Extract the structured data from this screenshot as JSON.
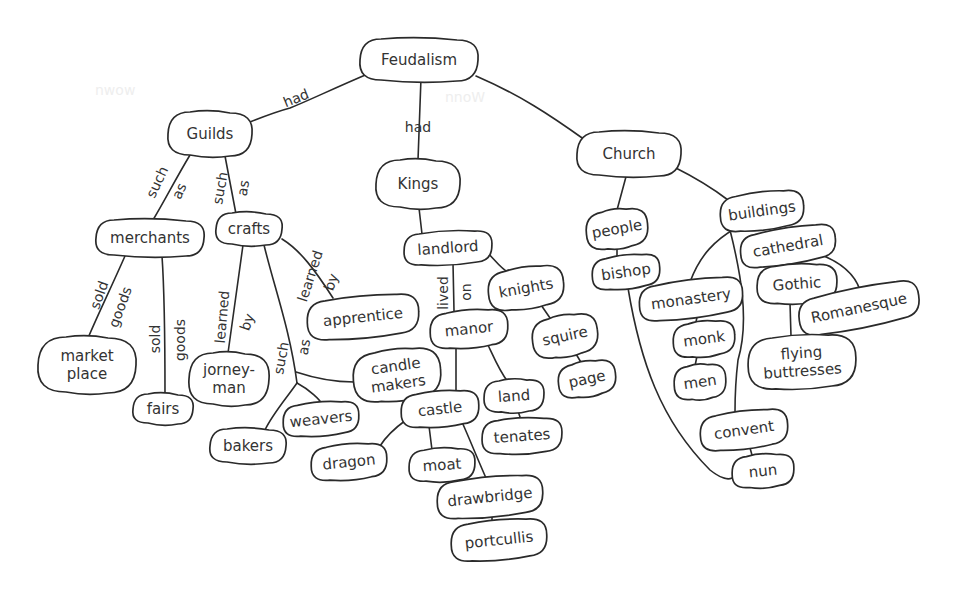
{
  "diagram": {
    "type": "concept-map",
    "root": "Feudalism",
    "colors": {
      "ink": "#2a2a2a",
      "text": "#333333",
      "background": "#ffffff"
    },
    "nodes": [
      {
        "id": "feudalism",
        "label": [
          "Feudalism"
        ],
        "x": 419,
        "y": 60,
        "w": 118,
        "h": 42,
        "rot": 0
      },
      {
        "id": "guilds",
        "label": [
          "Guilds"
        ],
        "x": 210,
        "y": 134,
        "w": 84,
        "h": 44,
        "rot": 0
      },
      {
        "id": "kings",
        "label": [
          "Kings"
        ],
        "x": 418,
        "y": 184,
        "w": 84,
        "h": 48,
        "rot": 0
      },
      {
        "id": "church",
        "label": [
          "Church"
        ],
        "x": 629,
        "y": 154,
        "w": 104,
        "h": 44,
        "rot": 0
      },
      {
        "id": "merchants",
        "label": [
          "merchants"
        ],
        "x": 150,
        "y": 238,
        "w": 108,
        "h": 36,
        "rot": 0
      },
      {
        "id": "crafts",
        "label": [
          "crafts"
        ],
        "x": 249,
        "y": 229,
        "w": 66,
        "h": 32,
        "rot": 0
      },
      {
        "id": "landlord",
        "label": [
          "landlord"
        ],
        "x": 448,
        "y": 248,
        "w": 88,
        "h": 32,
        "rot": -4
      },
      {
        "id": "people",
        "label": [
          "people"
        ],
        "x": 617,
        "y": 229,
        "w": 62,
        "h": 38,
        "rot": -10
      },
      {
        "id": "buildings",
        "label": [
          "buildings"
        ],
        "x": 762,
        "y": 211,
        "w": 84,
        "h": 36,
        "rot": -8
      },
      {
        "id": "marketplace",
        "label": [
          "market",
          "place"
        ],
        "x": 87,
        "y": 365,
        "w": 98,
        "h": 56,
        "rot": 0
      },
      {
        "id": "fairs",
        "label": [
          "fairs"
        ],
        "x": 163,
        "y": 409,
        "w": 60,
        "h": 30,
        "rot": 0
      },
      {
        "id": "jorneyman",
        "label": [
          "jorney-",
          "man"
        ],
        "x": 229,
        "y": 379,
        "w": 80,
        "h": 52,
        "rot": 0
      },
      {
        "id": "apprentice",
        "label": [
          "apprentice"
        ],
        "x": 363,
        "y": 317,
        "w": 112,
        "h": 40,
        "rot": -6
      },
      {
        "id": "candlemakers",
        "label": [
          "candle",
          "makers"
        ],
        "x": 397,
        "y": 375,
        "w": 88,
        "h": 50,
        "rot": -8
      },
      {
        "id": "weavers",
        "label": [
          "weavers"
        ],
        "x": 321,
        "y": 419,
        "w": 76,
        "h": 32,
        "rot": -6
      },
      {
        "id": "bakers",
        "label": [
          "bakers"
        ],
        "x": 248,
        "y": 446,
        "w": 76,
        "h": 34,
        "rot": 0
      },
      {
        "id": "knights",
        "label": [
          "knights"
        ],
        "x": 526,
        "y": 288,
        "w": 76,
        "h": 40,
        "rot": -10
      },
      {
        "id": "manor",
        "label": [
          "manor"
        ],
        "x": 469,
        "y": 329,
        "w": 78,
        "h": 36,
        "rot": -6
      },
      {
        "id": "squire",
        "label": [
          "squire"
        ],
        "x": 565,
        "y": 336,
        "w": 66,
        "h": 40,
        "rot": -12
      },
      {
        "id": "page",
        "label": [
          "page"
        ],
        "x": 587,
        "y": 379,
        "w": 58,
        "h": 34,
        "rot": -12
      },
      {
        "id": "castle",
        "label": [
          "castle"
        ],
        "x": 440,
        "y": 409,
        "w": 78,
        "h": 34,
        "rot": -6
      },
      {
        "id": "land",
        "label": [
          "land"
        ],
        "x": 514,
        "y": 396,
        "w": 60,
        "h": 32,
        "rot": -4
      },
      {
        "id": "tenates",
        "label": [
          "tenates"
        ],
        "x": 522,
        "y": 436,
        "w": 80,
        "h": 34,
        "rot": -4
      },
      {
        "id": "dragon",
        "label": [
          "dragon"
        ],
        "x": 349,
        "y": 462,
        "w": 76,
        "h": 34,
        "rot": -6
      },
      {
        "id": "moat",
        "label": [
          "moat"
        ],
        "x": 442,
        "y": 465,
        "w": 66,
        "h": 32,
        "rot": -4
      },
      {
        "id": "drawbridge",
        "label": [
          "drawbridge"
        ],
        "x": 490,
        "y": 497,
        "w": 106,
        "h": 38,
        "rot": -6
      },
      {
        "id": "portcullis",
        "label": [
          "portcullis"
        ],
        "x": 499,
        "y": 540,
        "w": 96,
        "h": 38,
        "rot": -6
      },
      {
        "id": "bishop",
        "label": [
          "bishop"
        ],
        "x": 626,
        "y": 272,
        "w": 68,
        "h": 32,
        "rot": -8
      },
      {
        "id": "cathedral",
        "label": [
          "cathedral"
        ],
        "x": 788,
        "y": 246,
        "w": 96,
        "h": 34,
        "rot": -10
      },
      {
        "id": "monastery",
        "label": [
          "monastery"
        ],
        "x": 691,
        "y": 299,
        "w": 104,
        "h": 36,
        "rot": -8
      },
      {
        "id": "gothic",
        "label": [
          "Gothic"
        ],
        "x": 797,
        "y": 284,
        "w": 80,
        "h": 38,
        "rot": -4
      },
      {
        "id": "romanesque",
        "label": [
          "Romanesque"
        ],
        "x": 859,
        "y": 308,
        "w": 122,
        "h": 38,
        "rot": -12
      },
      {
        "id": "monk",
        "label": [
          "monk"
        ],
        "x": 704,
        "y": 339,
        "w": 62,
        "h": 34,
        "rot": -8
      },
      {
        "id": "men",
        "label": [
          "men"
        ],
        "x": 700,
        "y": 382,
        "w": 52,
        "h": 34,
        "rot": -8
      },
      {
        "id": "flyingbuttresses",
        "label": [
          "flying",
          "buttresses"
        ],
        "x": 802,
        "y": 362,
        "w": 108,
        "h": 52,
        "rot": -4
      },
      {
        "id": "convent",
        "label": [
          "convent"
        ],
        "x": 744,
        "y": 430,
        "w": 88,
        "h": 36,
        "rot": -8
      },
      {
        "id": "nun",
        "label": [
          "nun"
        ],
        "x": 763,
        "y": 471,
        "w": 62,
        "h": 32,
        "rot": -6
      }
    ],
    "edges": [
      {
        "from": "feudalism",
        "to": "guilds",
        "path": "M370,73 C330,90 310,100 290,108 C275,112 260,118 250,122"
      },
      {
        "from": "feudalism",
        "to": "kings",
        "path": "M421,78 L418,160"
      },
      {
        "from": "feudalism",
        "to": "church",
        "path": "M476,76 C520,95 550,115 585,140"
      },
      {
        "from": "guilds",
        "to": "merchants",
        "path": "M190,155 C175,180 165,200 153,220"
      },
      {
        "from": "guilds",
        "to": "crafts",
        "path": "M225,156 L236,214"
      },
      {
        "from": "kings",
        "to": "landlord",
        "path": "M419,208 L422,234"
      },
      {
        "from": "church",
        "to": "people",
        "path": "M627,173 L617,210"
      },
      {
        "from": "church",
        "to": "buildings",
        "path": "M674,167 C700,180 715,190 728,200"
      },
      {
        "from": "merchants",
        "to": "marketplace",
        "path": "M125,256 C110,290 100,310 88,338"
      },
      {
        "from": "merchants",
        "to": "fairs",
        "path": "M162,256 C165,300 165,350 165,394"
      },
      {
        "from": "crafts",
        "to": "jorneyman",
        "path": "M243,245 L228,353"
      },
      {
        "from": "crafts",
        "to": "apprentice",
        "path": "M282,239 C300,250 315,270 333,298"
      },
      {
        "from": "crafts",
        "to": "junction",
        "path": "M264,245 C275,290 290,330 297,383"
      },
      {
        "from": "junction",
        "to": "candlemakers",
        "path": "M296,372 C320,380 340,382 354,382"
      },
      {
        "from": "junction",
        "to": "weavers",
        "path": "M297,383 C310,390 320,400 322,404"
      },
      {
        "from": "junction",
        "to": "bakers",
        "path": "M297,383 C285,400 272,415 265,430"
      },
      {
        "from": "landlord",
        "to": "manor",
        "path": "M453,263 L454,311"
      },
      {
        "from": "landlord",
        "to": "knights",
        "path": "M484,249 C495,260 502,270 508,272"
      },
      {
        "from": "knights",
        "to": "squire",
        "path": "M539,302 L550,318"
      },
      {
        "from": "squire",
        "to": "page",
        "path": "M576,354 L582,364"
      },
      {
        "from": "manor",
        "to": "castle",
        "path": "M456,347 L456,392"
      },
      {
        "from": "manor",
        "to": "land",
        "path": "M488,345 C495,360 500,372 508,382"
      },
      {
        "from": "land",
        "to": "tenates",
        "path": "M518,411 L521,420"
      },
      {
        "from": "castle",
        "to": "dragon",
        "path": "M406,420 C395,428 385,438 380,446"
      },
      {
        "from": "castle",
        "to": "moat",
        "path": "M429,426 L432,450"
      },
      {
        "from": "castle",
        "to": "drawbridge",
        "path": "M462,422 C470,440 478,460 486,478"
      },
      {
        "from": "drawbridge",
        "to": "portcullis",
        "path": "M492,516 L492,522"
      },
      {
        "from": "people",
        "to": "bishop",
        "path": "M617,247 L617,257"
      },
      {
        "from": "bishop",
        "to": "nun",
        "path": "M628,288 C640,360 660,420 710,470 C720,478 728,480 732,478"
      },
      {
        "from": "buildings",
        "to": "monastery",
        "path": "M736,228 C715,240 700,255 690,282"
      },
      {
        "from": "buildings",
        "to": "convent",
        "path": "M730,230 C740,270 750,320 738,360 C735,385 735,400 735,412"
      },
      {
        "from": "buildings",
        "to": "cathedral",
        "path": "M774,228 L776,232"
      },
      {
        "from": "cathedral",
        "to": "gothic",
        "path": "M792,262 L793,265"
      },
      {
        "from": "cathedral",
        "to": "romanesque",
        "path": "M810,251 C840,260 855,275 860,290"
      },
      {
        "from": "gothic",
        "to": "flyingbuttresses",
        "path": "M790,303 L791,336"
      },
      {
        "from": "monastery",
        "to": "monk",
        "path": "M697,317 L696,322"
      },
      {
        "from": "monk",
        "to": "men",
        "path": "M697,356 L695,366"
      },
      {
        "from": "convent",
        "to": "nun",
        "path": "M750,448 L752,455"
      }
    ],
    "link_labels": [
      {
        "text": "had",
        "x": 296,
        "y": 98,
        "rot": -22
      },
      {
        "text": "had",
        "x": 418,
        "y": 127,
        "rot": 0
      },
      {
        "text": "such",
        "x": 157,
        "y": 182,
        "rot": -65
      },
      {
        "text": "as",
        "x": 179,
        "y": 191,
        "rot": -65
      },
      {
        "text": "such",
        "x": 220,
        "y": 188,
        "rot": -80
      },
      {
        "text": "as",
        "x": 243,
        "y": 188,
        "rot": -80
      },
      {
        "text": "sold",
        "x": 99,
        "y": 295,
        "rot": -70
      },
      {
        "text": "goods",
        "x": 120,
        "y": 307,
        "rot": -70
      },
      {
        "text": "sold",
        "x": 155,
        "y": 339,
        "rot": -90
      },
      {
        "text": "goods",
        "x": 180,
        "y": 340,
        "rot": -90
      },
      {
        "text": "learned",
        "x": 222,
        "y": 317,
        "rot": -85
      },
      {
        "text": "by",
        "x": 247,
        "y": 322,
        "rot": -70
      },
      {
        "text": "learned",
        "x": 310,
        "y": 276,
        "rot": -72
      },
      {
        "text": "by",
        "x": 331,
        "y": 282,
        "rot": -70
      },
      {
        "text": "such",
        "x": 281,
        "y": 358,
        "rot": -80
      },
      {
        "text": "as",
        "x": 304,
        "y": 347,
        "rot": -80
      },
      {
        "text": "lived",
        "x": 443,
        "y": 293,
        "rot": -90
      },
      {
        "text": "on",
        "x": 466,
        "y": 292,
        "rot": -90
      }
    ],
    "ghost_marks": [
      {
        "text": "nwow",
        "x": 95,
        "y": 95
      },
      {
        "text": "nnoW",
        "x": 445,
        "y": 102
      }
    ]
  }
}
